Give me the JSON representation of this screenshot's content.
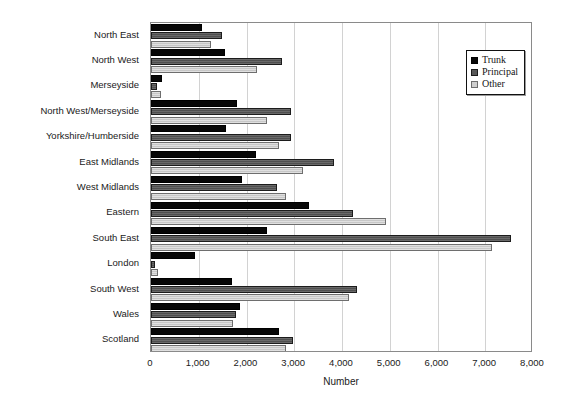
{
  "chart_data": {
    "type": "bar",
    "orientation": "horizontal",
    "title": "",
    "xlabel": "Number",
    "ylabel": "",
    "xlim": [
      0,
      8000
    ],
    "xticks": [
      "0",
      "1,000",
      "2,000",
      "3,000",
      "4,000",
      "5,000",
      "6,000",
      "7,000",
      "8,000"
    ],
    "xtick_values": [
      0,
      1000,
      2000,
      3000,
      4000,
      5000,
      6000,
      7000,
      8000
    ],
    "grid": true,
    "grid_axis": "x",
    "legend_position": "top-right",
    "categories": [
      "North East",
      "North West",
      "Merseyside",
      "North West/Merseyside",
      "Yorkshire/Humberside",
      "East Midlands",
      "West Midlands",
      "Eastern",
      "South East",
      "London",
      "South West",
      "Wales",
      "Scotland"
    ],
    "series": [
      {
        "name": "Trunk",
        "color": "#070707",
        "values": [
          1060,
          1550,
          230,
          1800,
          1570,
          2200,
          1900,
          3300,
          2430,
          920,
          1700,
          1860,
          2680
        ]
      },
      {
        "name": "Principal",
        "color": "#585858",
        "values": [
          1490,
          2750,
          130,
          2930,
          2930,
          3830,
          2640,
          4230,
          7530,
          80,
          4320,
          1790,
          2970
        ]
      },
      {
        "name": "Other",
        "color": "#cfcfcf",
        "values": [
          1250,
          2220,
          200,
          2430,
          2680,
          3180,
          2830,
          4920,
          7150,
          150,
          4140,
          1710,
          2820
        ]
      }
    ]
  },
  "legend": {
    "items": [
      {
        "label": "Trunk"
      },
      {
        "label": "Principal"
      },
      {
        "label": "Other"
      }
    ]
  }
}
